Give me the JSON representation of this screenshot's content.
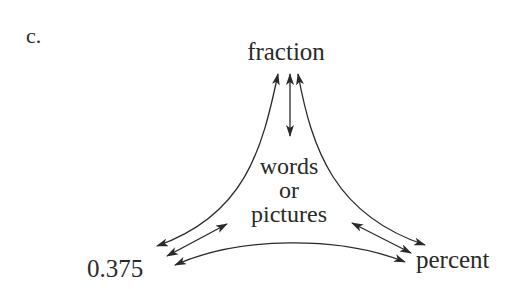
{
  "figure": {
    "panel_label": "c.",
    "nodes": {
      "top": "fraction",
      "left": "0.375",
      "right": "percent",
      "center_line1": "words",
      "center_line2": "or",
      "center_line3": "pictures"
    },
    "edges": [
      {
        "from": "fraction",
        "to": "0.375",
        "type": "bidirectional"
      },
      {
        "from": "fraction",
        "to": "percent",
        "type": "bidirectional"
      },
      {
        "from": "fraction",
        "to": "words or pictures",
        "type": "bidirectional"
      },
      {
        "from": "0.375",
        "to": "words or pictures",
        "type": "bidirectional"
      },
      {
        "from": "percent",
        "to": "words or pictures",
        "type": "bidirectional"
      },
      {
        "from": "0.375",
        "to": "percent",
        "type": "bidirectional"
      }
    ],
    "colors": {
      "stroke": "#2a2a2a",
      "background": "#ffffff"
    }
  }
}
